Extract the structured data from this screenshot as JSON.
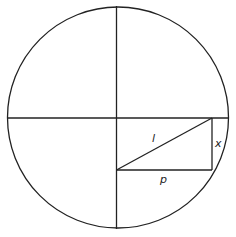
{
  "diagram": {
    "labels": {
      "hypotenuse": "l",
      "vertical_side": "x",
      "horizontal_side": "p"
    },
    "stroke_color": "#222222",
    "background": "#ffffff"
  }
}
